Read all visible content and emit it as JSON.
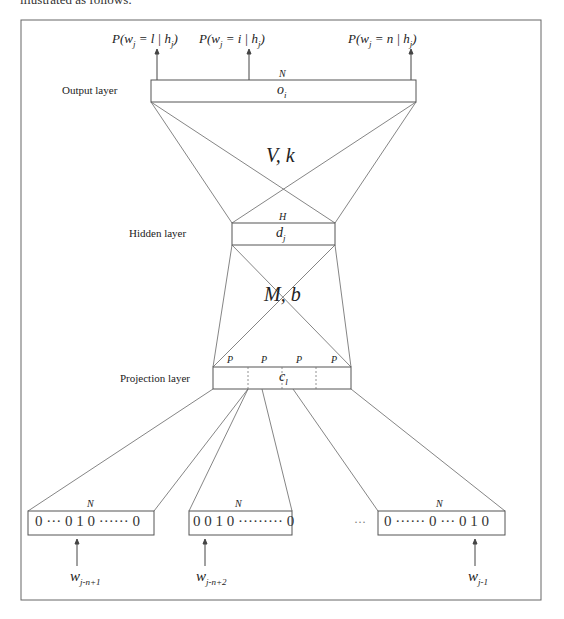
{
  "header_fragment": "illustrated as follows:",
  "layers": {
    "output": {
      "label": "Output layer",
      "size_label": "N",
      "unit": "o",
      "unit_sub": "i"
    },
    "hidden": {
      "label": "Hidden layer",
      "size_label": "H",
      "unit": "d",
      "unit_sub": "j"
    },
    "projection": {
      "label": "Projection layer",
      "size_labels": [
        "P",
        "P",
        "P",
        "P"
      ],
      "unit": "c",
      "unit_sub": "l"
    }
  },
  "weights": {
    "output_hidden": "V, k",
    "hidden_projection": "M, b"
  },
  "outputs": [
    {
      "prefix": "P(w",
      "sub1": "j",
      "mid": " = l | h",
      "sub2": "j",
      "suffix": ")"
    },
    {
      "prefix": "P(w",
      "sub1": "j",
      "mid": " = i | h",
      "sub2": "j",
      "suffix": ")"
    },
    {
      "prefix": "P(w",
      "sub1": "j",
      "mid": " = n | h",
      "sub2": "j",
      "suffix": ")"
    }
  ],
  "input_vectors": [
    {
      "size_label": "N",
      "content": "0 ··· 0 1 0 ······ 0",
      "word": "w",
      "word_sub": "j-n+1"
    },
    {
      "size_label": "N",
      "content": "0 0 1 0  ········· 0",
      "word": "w",
      "word_sub": "j-n+2"
    },
    {
      "size_label": "N",
      "content": "0 ······ 0 ··· 0 1 0",
      "word": "w",
      "word_sub": "j-1"
    }
  ],
  "ellipsis": "···",
  "colors": {
    "line": "#555555",
    "frame": "#666666",
    "text": "#222222"
  }
}
